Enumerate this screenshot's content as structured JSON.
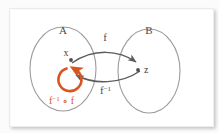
{
  "figure": {
    "background_color": "#ffffff",
    "card_color": "#ffffff",
    "ellipse_stroke": "#9a9a9a",
    "arrow_color": "#5c5c5c",
    "accent_color": "#d9551f",
    "point_color": "#555555"
  },
  "sets": [
    {
      "id": "A",
      "label": "A",
      "cx": 63,
      "cy": 68,
      "rx": 36,
      "ry": 44
    },
    {
      "id": "B",
      "label": "B",
      "cx": 149,
      "cy": 70,
      "rx": 33,
      "ry": 44
    }
  ],
  "elements": [
    {
      "id": "x",
      "label": "x",
      "set": "A",
      "cx": 68,
      "cy": 60
    },
    {
      "id": "z",
      "label": "z",
      "set": "B",
      "cx": 136,
      "cy": 70
    }
  ],
  "maps": [
    {
      "id": "f",
      "label": "f",
      "superscript": "",
      "from": "x",
      "to": "z",
      "direction": "A-to-B",
      "label_x": 105,
      "label_y": 37
    },
    {
      "id": "f-inverse",
      "label": "f",
      "superscript": "−1",
      "from": "z",
      "to": "x",
      "direction": "B-to-A",
      "label_x": 101,
      "label_y": 93
    }
  ],
  "composition": {
    "id": "f-inverse-compose-f",
    "label_parts": [
      "f",
      "−1",
      " ∘ f"
    ],
    "label_text": "f⁻¹ ∘ f",
    "color": "#d9551f",
    "loop": {
      "cx": 62,
      "cy": 76,
      "r": 12,
      "direction": "counterclockwise"
    },
    "label_x": 62,
    "label_y": 99
  }
}
